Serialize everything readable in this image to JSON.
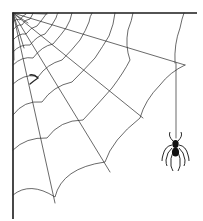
{
  "image": {
    "subject": "corner spider web with hanging spider",
    "background": "#ffffff",
    "line_color": "#2a2a2a",
    "frame_color": "#1a1a1a"
  },
  "web": {
    "anchor": [
      13,
      13
    ],
    "radials": [
      [
        197,
        13
      ],
      [
        185,
        64
      ],
      [
        143,
        118
      ],
      [
        110,
        172
      ],
      [
        55,
        202
      ],
      [
        13,
        218
      ],
      [
        75,
        20
      ],
      [
        40,
        35
      ]
    ]
  },
  "spider": {
    "thread_x": 176,
    "thread_top": 63,
    "body_center": [
      175,
      147
    ]
  }
}
